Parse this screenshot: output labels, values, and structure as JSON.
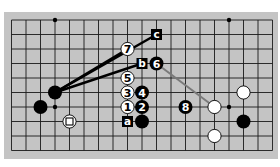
{
  "diagram": {
    "board": {
      "columns": 19,
      "visible_rows": 10,
      "background_color": "#c4c4c4",
      "line_color": "#1a1a1a"
    },
    "star_points": [
      {
        "col": 3,
        "row": 0
      },
      {
        "col": 15,
        "row": 0
      },
      {
        "col": 3,
        "row": 6
      },
      {
        "col": 15,
        "row": 6
      }
    ],
    "stones": [
      {
        "color": "black",
        "col": 3,
        "row": 5,
        "label": ""
      },
      {
        "color": "black",
        "col": 2,
        "row": 6,
        "label": ""
      },
      {
        "color": "white",
        "col": 4,
        "row": 7,
        "label": "",
        "marker": "square"
      },
      {
        "color": "white",
        "col": 8,
        "row": 2,
        "label": "7"
      },
      {
        "color": "black",
        "col": 10,
        "row": 3,
        "label": "6"
      },
      {
        "color": "white",
        "col": 8,
        "row": 4,
        "label": "5"
      },
      {
        "color": "white",
        "col": 8,
        "row": 5,
        "label": "3"
      },
      {
        "color": "black",
        "col": 9,
        "row": 5,
        "label": "4"
      },
      {
        "color": "white",
        "col": 8,
        "row": 6,
        "label": "1"
      },
      {
        "color": "black",
        "col": 9,
        "row": 6,
        "label": "2"
      },
      {
        "color": "black",
        "col": 9,
        "row": 7,
        "label": ""
      },
      {
        "color": "black",
        "col": 12,
        "row": 6,
        "label": "8"
      },
      {
        "color": "white",
        "col": 14,
        "row": 6,
        "label": ""
      },
      {
        "color": "white",
        "col": 16,
        "row": 5,
        "label": ""
      },
      {
        "color": "black",
        "col": 16,
        "row": 7,
        "label": ""
      },
      {
        "color": "white",
        "col": 14,
        "row": 8,
        "label": ""
      }
    ],
    "letter_markers": [
      {
        "label": "c",
        "col": 10,
        "row": 1
      },
      {
        "label": "b",
        "col": 9,
        "row": 3
      },
      {
        "label": "a",
        "col": 8,
        "row": 7
      }
    ],
    "connection_lines": [
      {
        "from": {
          "col": 3,
          "row": 5
        },
        "to": {
          "col": 8,
          "row": 2
        },
        "color": "#000000"
      },
      {
        "from": {
          "col": 3,
          "row": 5
        },
        "to": {
          "col": 10,
          "row": 1
        },
        "color": "#000000"
      },
      {
        "from": {
          "col": 3,
          "row": 5
        },
        "to": {
          "col": 9,
          "row": 3
        },
        "color": "#000000"
      },
      {
        "from": {
          "col": 10,
          "row": 3
        },
        "to": {
          "col": 14,
          "row": 6
        },
        "color": "#7a7a7a"
      }
    ]
  }
}
